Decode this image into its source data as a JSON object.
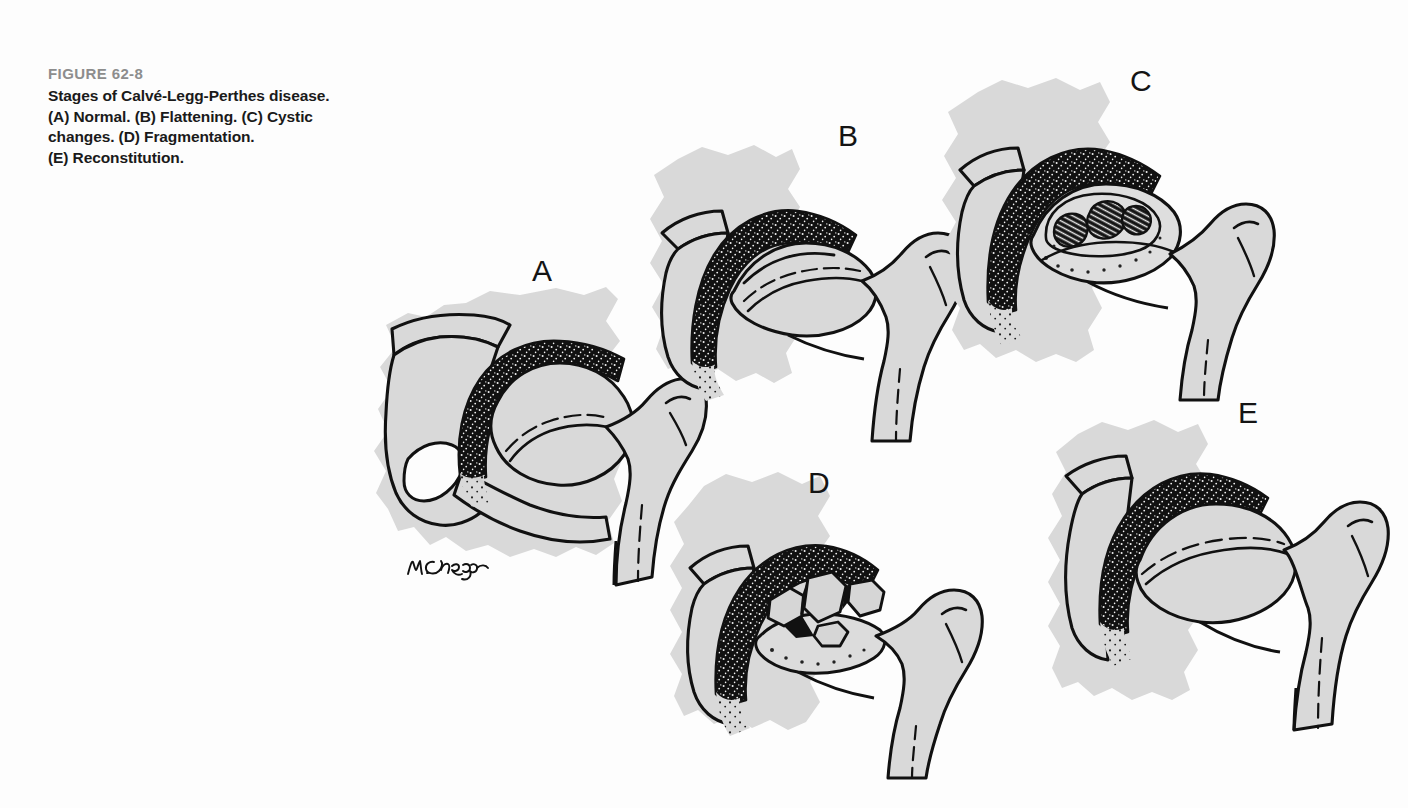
{
  "figure": {
    "number": "FIGURE 62-8",
    "caption_lines": [
      "Stages of Calvé-Legg-Perthes disease.",
      "(A) Normal. (B) Flattening. (C) Cystic",
      "changes. (D) Fragmentation.",
      "(E) Reconstitution."
    ],
    "caption_full": "Stages of Calvé-Legg-Perthes disease. (A) Normal. (B) Flattening. (C) Cystic changes. (D) Fragmentation. (E) Reconstitution.",
    "artist_signature": "M. Cramp"
  },
  "colors": {
    "background": "#fdfdfd",
    "bone_fill": "#d9d9d9",
    "bone_outline": "#111111",
    "cartilage_dark": "#111111",
    "figure_number_gray": "#8d8d8d",
    "caption_black": "#1a1a1a"
  },
  "panels": [
    {
      "id": "A",
      "label": "A",
      "stage": "Normal",
      "description": "Normal hip joint with intact spherical femoral head, uniform acetabular cartilage space, visible obturator foramen, greater and lesser trochanter."
    },
    {
      "id": "B",
      "label": "B",
      "stage": "Flattening",
      "description": "Femoral head shows early flattening of the superior articular surface with widened sclerotic acetabular band."
    },
    {
      "id": "C",
      "label": "C",
      "stage": "Cystic changes",
      "description": "Femoral head contains dark cystic lucencies beneath the flattened articular surface."
    },
    {
      "id": "D",
      "label": "D",
      "stage": "Fragmentation",
      "description": "Epiphysis broken into several irregular separated bone fragments within the joint space."
    },
    {
      "id": "E",
      "label": "E",
      "stage": "Reconstitution",
      "description": "Femoral head re-forms with restored but broadened contour and remodelled neck."
    }
  ]
}
